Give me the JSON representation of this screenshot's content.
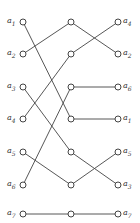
{
  "diagram": {
    "left_labels": [
      "a1",
      "a2",
      "a3",
      "a4",
      "a5",
      "a6",
      "a7"
    ],
    "right_labels": [
      "a4",
      "a2",
      "a6",
      "a1",
      "a5",
      "a3",
      "a7"
    ],
    "columns_x": [
      23,
      71,
      118
    ],
    "rows_y": [
      22,
      54,
      87,
      119,
      152,
      185,
      214
    ],
    "left_to_middle": [
      [
        0,
        3
      ],
      [
        1,
        0
      ],
      [
        2,
        4
      ],
      [
        3,
        1
      ],
      [
        4,
        5
      ],
      [
        5,
        2
      ],
      [
        6,
        6
      ]
    ],
    "middle_to_right": [
      [
        0,
        1
      ],
      [
        1,
        0
      ],
      [
        2,
        2
      ],
      [
        3,
        3
      ],
      [
        4,
        5
      ],
      [
        5,
        4
      ],
      [
        6,
        6
      ]
    ],
    "line_color": "#444444"
  }
}
